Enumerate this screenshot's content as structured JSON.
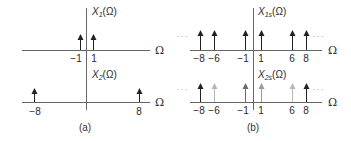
{
  "figure": {
    "panel_a": {
      "caption": "(a)",
      "top_plot": {
        "title_main": "X",
        "title_sub": "1",
        "title_arg": "(Ω)",
        "axis_label": "Ω",
        "impulses": [
          {
            "freq": -1,
            "label": "−1",
            "shade": "#222222"
          },
          {
            "freq": 1,
            "label": "1",
            "shade": "#222222"
          }
        ]
      },
      "bottom_plot": {
        "title_main": "X",
        "title_sub": "2",
        "title_arg": "(Ω)",
        "axis_label": "Ω",
        "impulses": [
          {
            "freq": -8,
            "label": "−8",
            "shade": "#222222"
          },
          {
            "freq": 8,
            "label": "8",
            "shade": "#222222"
          }
        ]
      }
    },
    "panel_b": {
      "caption": "(b)",
      "top_plot": {
        "title_main": "X",
        "title_sub": "1s",
        "title_arg": "(Ω)",
        "axis_label": "Ω",
        "ellipsis_left": "· · ·",
        "ellipsis_right": "· · ·",
        "impulses": [
          {
            "freq": -8,
            "label": "−8",
            "shade": "#222222"
          },
          {
            "freq": -6,
            "label": "−6",
            "shade": "#222222"
          },
          {
            "freq": -1,
            "label": "−1",
            "shade": "#222222"
          },
          {
            "freq": 1,
            "label": "1",
            "shade": "#222222"
          },
          {
            "freq": 6,
            "label": "6",
            "shade": "#222222"
          },
          {
            "freq": 8,
            "label": "8",
            "shade": "#222222"
          }
        ]
      },
      "bottom_plot": {
        "title_main": "X",
        "title_sub": "2s",
        "title_arg": "(Ω)",
        "axis_label": "Ω",
        "ellipsis_left": "· · ·",
        "ellipsis_right": "· · ·",
        "impulses": [
          {
            "freq": -8,
            "label": "−8",
            "shade": "#222222"
          },
          {
            "freq": -6,
            "label": "−6",
            "shade": "#b8b8b8"
          },
          {
            "freq": -1,
            "label": "−1",
            "shade": "#6a6a6a"
          },
          {
            "freq": 1,
            "label": "1",
            "shade": "#9a9a9a"
          },
          {
            "freq": 6,
            "label": "6",
            "shade": "#b8b8b8"
          },
          {
            "freq": 8,
            "label": "8",
            "shade": "#222222"
          }
        ]
      }
    }
  },
  "colors": {
    "axis": "#555555",
    "impulse_dark": "#222222",
    "impulse_mid": "#6a6a6a",
    "impulse_light": "#b8b8b8"
  }
}
